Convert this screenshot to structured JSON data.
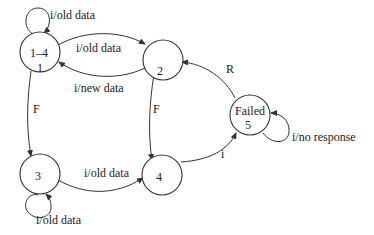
{
  "diagram": {
    "type": "state-machine",
    "states": [
      {
        "id": "s1",
        "label_top": "1–4",
        "label_bottom": "1"
      },
      {
        "id": "s2",
        "label_top": "",
        "label_bottom": "2"
      },
      {
        "id": "s3",
        "label_top": "",
        "label_bottom": "3"
      },
      {
        "id": "s4",
        "label_top": "",
        "label_bottom": "4"
      },
      {
        "id": "s5",
        "label_top": "Failed",
        "label_bottom": "5"
      }
    ],
    "transitions": [
      {
        "from": "s1",
        "to": "s1",
        "label": "i/old data"
      },
      {
        "from": "s1",
        "to": "s2",
        "label": "i/old data"
      },
      {
        "from": "s2",
        "to": "s1",
        "label": "i/new data"
      },
      {
        "from": "s1",
        "to": "s3",
        "label": "F"
      },
      {
        "from": "s2",
        "to": "s4",
        "label": "F"
      },
      {
        "from": "s5",
        "to": "s2",
        "label": "R"
      },
      {
        "from": "s5",
        "to": "s5",
        "label": "i/no response"
      },
      {
        "from": "s3",
        "to": "s3",
        "label": "i/old data"
      },
      {
        "from": "s3",
        "to": "s4",
        "label": "i/old data"
      },
      {
        "from": "s4",
        "to": "s5",
        "label": "i"
      }
    ]
  }
}
